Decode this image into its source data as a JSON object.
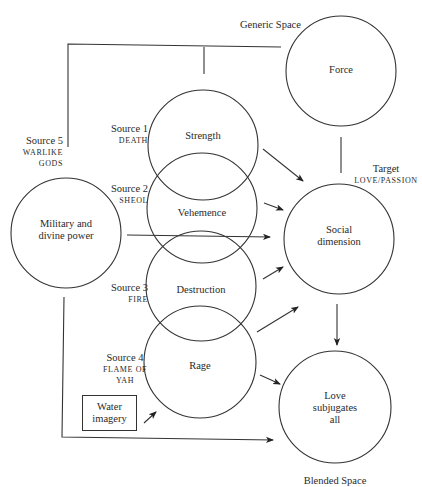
{
  "diagram": {
    "type": "conceptual-blending-network",
    "spaces": {
      "generic": {
        "label": "Generic Space",
        "concept": "Force"
      },
      "target": {
        "label": "Target",
        "sublabel": "LOVE/PASSION",
        "concept_line1": "Social",
        "concept_line2": "dimension"
      },
      "blended": {
        "label": "Blended Space",
        "concept_line1": "Love",
        "concept_line2": "subjugates",
        "concept_line3": "all"
      }
    },
    "sources": [
      {
        "label": "Source 1",
        "sublabel": "DEATH",
        "concept": "Strength"
      },
      {
        "label": "Source 2",
        "sublabel": "SHEOL",
        "concept": "Vehemence"
      },
      {
        "label": "Source 3",
        "sublabel": "FIRE",
        "concept": "Destruction"
      },
      {
        "label": "Source 4",
        "sublabel_line1": "FLAME OF",
        "sublabel_line2": "YAH",
        "concept": "Rage"
      },
      {
        "label": "Source 5",
        "sublabel_line1": "WARLIKE",
        "sublabel_line2": "GODS",
        "concept_line1": "Military and",
        "concept_line2": "divine power"
      }
    ],
    "extra_input": {
      "line1": "Water",
      "line2": "imagery"
    },
    "edges": [
      {
        "from": "Strength",
        "to": "Social dimension",
        "type": "arrow"
      },
      {
        "from": "Vehemence",
        "to": "Social dimension",
        "type": "arrow"
      },
      {
        "from": "Military and divine power",
        "to": "Social dimension",
        "type": "arrow"
      },
      {
        "from": "Destruction",
        "to": "Social dimension",
        "type": "arrow"
      },
      {
        "from": "Rage",
        "to": "Social dimension",
        "type": "arrow"
      },
      {
        "from": "Rage",
        "to": "Love subjugates all",
        "type": "arrow"
      },
      {
        "from": "Social dimension",
        "to": "Love subjugates all",
        "type": "arrow"
      },
      {
        "from": "Water imagery",
        "to": "Rage",
        "type": "arrow"
      },
      {
        "from": "Military and divine power",
        "to": "Love subjugates all",
        "type": "arrow"
      },
      {
        "from": "Force",
        "to": "Social dimension",
        "type": "line"
      },
      {
        "from": "Force",
        "to": "Sources",
        "type": "line"
      }
    ]
  }
}
